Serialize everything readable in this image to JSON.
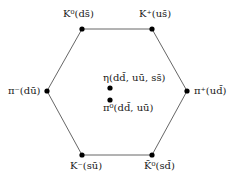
{
  "diagram": {
    "shape": "hexagon",
    "colors": {
      "line": "#555555",
      "node": "#000000",
      "text": "#1a1a1a",
      "background": "#ffffff"
    },
    "nodes": [
      {
        "id": "K0",
        "label": "K⁰(ds̄)",
        "x": 82,
        "y": 29
      },
      {
        "id": "Kplus",
        "label": "K⁺(us̄)",
        "x": 152,
        "y": 29
      },
      {
        "id": "piminus",
        "label": "π⁻(dū)",
        "x": 47,
        "y": 91
      },
      {
        "id": "piplus",
        "label": "π⁺(ud̄)",
        "x": 187,
        "y": 91
      },
      {
        "id": "Kminus",
        "label": "K⁻(sū)",
        "x": 82,
        "y": 155
      },
      {
        "id": "K0bar",
        "label": "K̄⁰(sd̄)",
        "x": 152,
        "y": 155
      },
      {
        "id": "eta",
        "label": "η(dd̄, uū, ss̄)",
        "x": 110,
        "y": 88
      },
      {
        "id": "pi0",
        "label": "π⁰(dd̄, uū)",
        "x": 110,
        "y": 100
      }
    ]
  }
}
